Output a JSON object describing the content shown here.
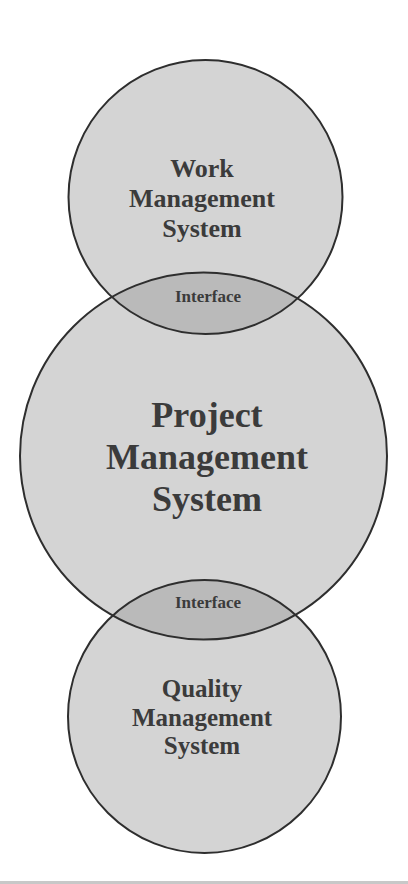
{
  "diagram": {
    "type": "overlapping-circles",
    "colors": {
      "background": "#ffffff",
      "circle_fill": "#d4d4d4",
      "overlap_fill": "#b9b9b9",
      "stroke": "#2e2e2e",
      "text": "#3b3b3b"
    },
    "circles": [
      {
        "id": "work",
        "lines": [
          "Work",
          "Management",
          "System"
        ]
      },
      {
        "id": "project",
        "lines": [
          "Project",
          "Management",
          "System"
        ]
      },
      {
        "id": "quality",
        "lines": [
          "Quality",
          "Management",
          "System"
        ]
      }
    ],
    "interfaces": [
      {
        "between": [
          "work",
          "project"
        ],
        "label": "Interface"
      },
      {
        "between": [
          "project",
          "quality"
        ],
        "label": "Interface"
      }
    ]
  }
}
